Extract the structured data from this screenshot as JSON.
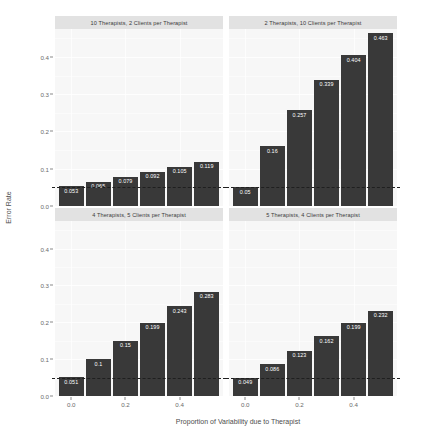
{
  "chart_data": {
    "type": "bar",
    "title": "",
    "xlabel": "Proportion of Variability due to Therapist",
    "ylabel": "Error Rate",
    "x": [
      0.0,
      0.1,
      0.2,
      0.3,
      0.4,
      0.5
    ],
    "xlim": [
      -0.06,
      0.56
    ],
    "ylim": [
      0.0,
      0.475
    ],
    "xticks": [
      "0.0",
      "0.2",
      "0.4"
    ],
    "xtick_values": [
      0.0,
      0.2,
      0.4
    ],
    "yticks": [
      "0.0",
      "0.1",
      "0.2",
      "0.3",
      "0.4"
    ],
    "ytick_values": [
      0.0,
      0.1,
      0.2,
      0.3,
      0.4
    ],
    "grid": true,
    "legend": "none",
    "facet_layout": "2x2",
    "reference_line": {
      "value": 0.05,
      "style": "dashed",
      "color": "#1f1f1f"
    },
    "bar_color": "#393939",
    "panel_background": "#f7f7f7",
    "strip_background": "#e2e2e2",
    "panels": [
      {
        "label": "10 Therapists, 2 Clients per Therapist",
        "row": 0,
        "col": 0,
        "values": [
          0.053,
          0.065,
          0.079,
          0.092,
          0.105,
          0.119
        ],
        "value_labels": [
          "0.053",
          "0.065",
          "0.079",
          "0.092",
          "0.105",
          "0.119"
        ]
      },
      {
        "label": "2 Therapists, 10 Clients per Therapist",
        "row": 0,
        "col": 1,
        "values": [
          0.05,
          0.16,
          0.257,
          0.339,
          0.404,
          0.463
        ],
        "value_labels": [
          "0.05",
          "0.16",
          "0.257",
          "0.339",
          "0.404",
          "0.463"
        ]
      },
      {
        "label": "4 Therapists, 5 Clients per Therapist",
        "row": 1,
        "col": 0,
        "values": [
          0.051,
          0.1,
          0.15,
          0.199,
          0.243,
          0.283
        ],
        "value_labels": [
          "0.051",
          "0.1",
          "0.15",
          "0.199",
          "0.243",
          "0.283"
        ]
      },
      {
        "label": "5 Therapists, 4 Clients per Therapist",
        "row": 1,
        "col": 1,
        "values": [
          0.049,
          0.086,
          0.123,
          0.162,
          0.199,
          0.232
        ],
        "value_labels": [
          "0.049",
          "0.086",
          "0.123",
          "0.162",
          "0.199",
          "0.232"
        ]
      }
    ]
  }
}
